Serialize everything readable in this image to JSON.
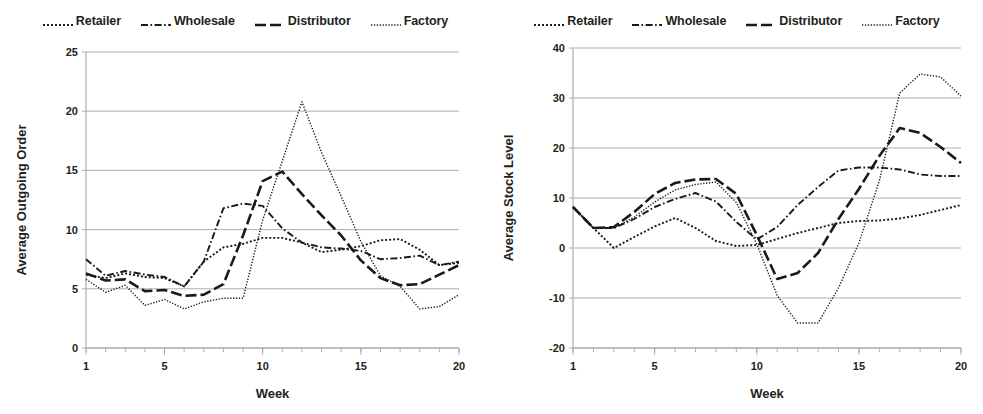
{
  "figure": {
    "background": "#ffffff",
    "line_color": "#1a1a1a",
    "grid_color": "#a6a6a6"
  },
  "legend": {
    "position": "top-center",
    "entries": [
      {
        "label": "Retailer",
        "dash": "2,2",
        "width": 1.9,
        "name": "retailer"
      },
      {
        "label": "Wholesale",
        "dash": "7,2.5,1.6,2.5",
        "width": 1.9,
        "name": "wholesale"
      },
      {
        "label": "Distributor",
        "dash": "11,4",
        "width": 2.6,
        "name": "distributor"
      },
      {
        "label": "Factory",
        "dash": "1.3,1.6",
        "width": 1.4,
        "name": "factory"
      }
    ]
  },
  "chart_data": [
    {
      "id": "outgoing-order",
      "type": "line",
      "title": "",
      "xlabel": "Week",
      "ylabel": "Average Outgoing Order",
      "xlim": [
        1,
        20
      ],
      "ylim": [
        0,
        25
      ],
      "yticks": [
        0,
        5,
        10,
        15,
        20,
        25
      ],
      "xticks": [
        1,
        5,
        10,
        15,
        20
      ],
      "x_minor_ticks": [
        1,
        2,
        3,
        4,
        5,
        6,
        7,
        8,
        9,
        10,
        11,
        12,
        13,
        14,
        15,
        16,
        17,
        18,
        19,
        20
      ],
      "grid": "horizontal",
      "x": [
        1,
        2,
        3,
        4,
        5,
        6,
        7,
        8,
        9,
        10,
        11,
        12,
        13,
        14,
        15,
        16,
        17,
        18,
        19,
        20
      ],
      "series": [
        {
          "name": "Retailer",
          "values": [
            6.2,
            5.9,
            6.3,
            6.0,
            5.9,
            5.2,
            7.3,
            8.5,
            8.8,
            9.3,
            9.3,
            8.9,
            8.1,
            8.3,
            8.6,
            9.1,
            9.2,
            8.3,
            7.0,
            7.2
          ]
        },
        {
          "name": "Wholesale",
          "values": [
            7.5,
            6.1,
            6.5,
            6.2,
            6.0,
            5.2,
            7.3,
            11.8,
            12.2,
            12.0,
            10.1,
            8.9,
            8.5,
            8.4,
            8.2,
            7.5,
            7.6,
            7.8,
            7.0,
            7.3
          ]
        },
        {
          "name": "Distributor",
          "values": [
            6.3,
            5.7,
            5.8,
            4.8,
            4.9,
            4.4,
            4.5,
            5.4,
            9.5,
            14.1,
            14.9,
            13.0,
            11.2,
            9.5,
            7.4,
            5.9,
            5.3,
            5.4,
            6.2,
            7.0
          ]
        },
        {
          "name": "Factory",
          "values": [
            5.8,
            4.7,
            5.3,
            3.6,
            4.1,
            3.3,
            3.9,
            4.2,
            4.2,
            10.8,
            15.8,
            20.8,
            16.5,
            12.8,
            9.0,
            6.1,
            5.2,
            3.3,
            3.5,
            4.5
          ]
        }
      ]
    },
    {
      "id": "stock-level",
      "type": "line",
      "title": "",
      "xlabel": "Week",
      "ylabel": "Average Stock Level",
      "xlim": [
        1,
        20
      ],
      "ylim": [
        -20,
        40
      ],
      "yticks": [
        -20,
        -10,
        0,
        10,
        20,
        30,
        40
      ],
      "xticks": [
        1,
        5,
        10,
        15,
        20
      ],
      "x_minor_ticks": [
        1,
        2,
        3,
        4,
        5,
        6,
        7,
        8,
        9,
        10,
        11,
        12,
        13,
        14,
        15,
        16,
        17,
        18,
        19,
        20
      ],
      "grid": "horizontal",
      "x": [
        1,
        2,
        3,
        4,
        5,
        6,
        7,
        8,
        9,
        10,
        11,
        12,
        13,
        14,
        15,
        16,
        17,
        18,
        19,
        20
      ],
      "series": [
        {
          "name": "Retailer",
          "values": [
            8.2,
            4.0,
            0.0,
            2.2,
            4.3,
            6.0,
            4.0,
            1.4,
            0.4,
            0.6,
            1.8,
            3.0,
            4.0,
            5.0,
            5.4,
            5.5,
            5.9,
            6.6,
            7.6,
            8.6
          ]
        },
        {
          "name": "Wholesale",
          "values": [
            8.2,
            4.0,
            4.0,
            5.8,
            8.2,
            9.8,
            11.0,
            9.3,
            5.2,
            1.7,
            4.2,
            8.6,
            12.2,
            15.5,
            16.1,
            16.1,
            15.7,
            14.7,
            14.4,
            14.4
          ]
        },
        {
          "name": "Distributor",
          "values": [
            8.2,
            4.0,
            4.2,
            7.2,
            10.8,
            13.0,
            13.7,
            13.8,
            10.8,
            2.6,
            -6.2,
            -5.0,
            -1.0,
            5.8,
            11.8,
            18.4,
            24.0,
            23.0,
            20.2,
            17.0
          ]
        },
        {
          "name": "Factory",
          "values": [
            8.2,
            4.0,
            4.0,
            6.2,
            9.2,
            11.6,
            12.7,
            13.2,
            9.1,
            0.8,
            -9.5,
            -15.0,
            -15.0,
            -8.0,
            1.0,
            13.4,
            31.0,
            34.8,
            34.2,
            30.4
          ]
        }
      ]
    }
  ]
}
